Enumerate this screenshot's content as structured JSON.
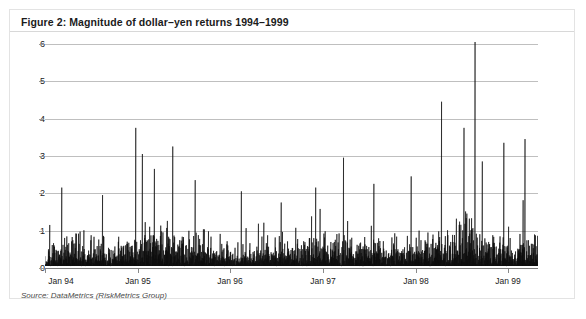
{
  "figure": {
    "title": "Figure 2: Magnitude of dollar–yen returns 1994–1999",
    "source": "Source: DataMetrics (RiskMetrics Group)",
    "frame_color": "#e3e3e3",
    "series_color": "#101010",
    "grid_color": "#bfbfbf",
    "background": "#ffffff"
  },
  "chart_data": {
    "type": "line",
    "title": "Figure 2: Magnitude of dollar–yen returns 1994–1999",
    "subtitle": "",
    "xlabel": "",
    "ylabel": "",
    "grid": true,
    "gridlines": "horizontal",
    "legend": "none",
    "ylim": [
      0,
      6
    ],
    "ytick_labels": [
      "0",
      "1",
      "2",
      "3",
      "4",
      "5",
      "6"
    ],
    "ytick_values": [
      0,
      1,
      2,
      3,
      4,
      5,
      6
    ],
    "xtick_labels": [
      "Jan 94",
      "Jan 95",
      "Jan 96",
      "Jan 97",
      "Jan 98",
      "Jan 99"
    ],
    "xtick_values": [
      0,
      1,
      2,
      3,
      4,
      5
    ],
    "xlim": [
      0,
      5.32
    ],
    "series": [
      {
        "name": "Absolute dollar-yen daily return (%)",
        "notes": "Daily absolute FX return magnitudes; dense spike plot. Highest spike exceeds the 6 axis limit (~6.6) near Oct 1998.",
        "peaks": [
          {
            "x": 0.18,
            "y": 2.1
          },
          {
            "x": 0.62,
            "y": 1.9
          },
          {
            "x": 0.98,
            "y": 3.7
          },
          {
            "x": 1.05,
            "y": 3.0
          },
          {
            "x": 1.18,
            "y": 2.6
          },
          {
            "x": 1.38,
            "y": 3.2
          },
          {
            "x": 1.62,
            "y": 2.3
          },
          {
            "x": 2.12,
            "y": 2.0
          },
          {
            "x": 2.55,
            "y": 1.7
          },
          {
            "x": 2.92,
            "y": 2.1
          },
          {
            "x": 3.22,
            "y": 2.9
          },
          {
            "x": 3.55,
            "y": 2.2
          },
          {
            "x": 3.95,
            "y": 2.4
          },
          {
            "x": 4.28,
            "y": 4.4
          },
          {
            "x": 4.52,
            "y": 3.7
          },
          {
            "x": 4.64,
            "y": 6.6
          },
          {
            "x": 4.72,
            "y": 2.8
          },
          {
            "x": 4.95,
            "y": 3.3
          },
          {
            "x": 5.18,
            "y": 3.4
          }
        ]
      }
    ]
  }
}
